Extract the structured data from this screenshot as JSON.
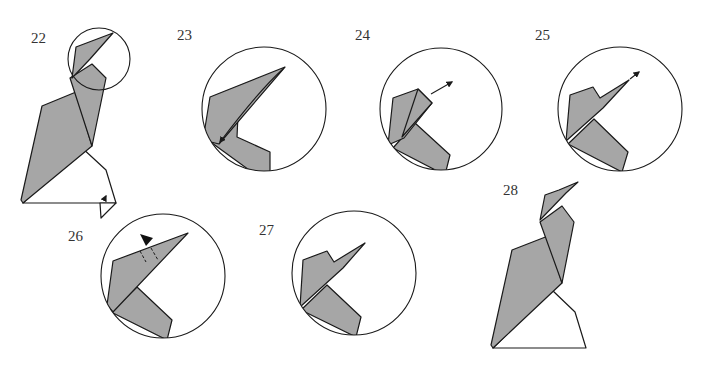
{
  "diagram": {
    "colors": {
      "paper_gray": "#a6a6a6",
      "line": "#1a1a1a",
      "background": "#ffffff"
    },
    "steps": [
      {
        "number": "22",
        "description": "full bird model with circled head detail, arrow at base"
      },
      {
        "number": "23",
        "description": "head close-up with curved arrow fold down along crease"
      },
      {
        "number": "24",
        "description": "head close-up with arrow pulling beak tip out"
      },
      {
        "number": "25",
        "description": "head close-up with beak extended, arrow at tip"
      },
      {
        "number": "26",
        "description": "head close-up with push (sink) arrow and dashed crease lines"
      },
      {
        "number": "27",
        "description": "head close-up, result"
      },
      {
        "number": "28",
        "description": "completed model"
      }
    ]
  }
}
